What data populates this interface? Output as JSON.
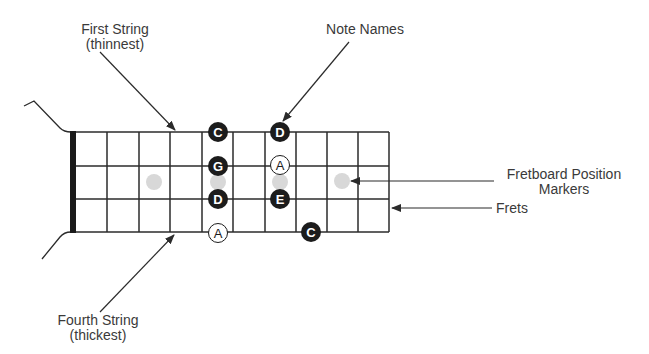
{
  "labels": {
    "first_string": {
      "line1": "First String",
      "line2": "(thinnest)"
    },
    "note_names": {
      "line1": "Note Names"
    },
    "position_markers": {
      "line1": "Fretboard Position",
      "line2": "Markers"
    },
    "frets": {
      "line1": "Frets"
    },
    "fourth_string": {
      "line1": "Fourth String",
      "line2": "(thickest)"
    }
  },
  "fretboard": {
    "strings": 4,
    "fret_spaces": 10,
    "colors": {
      "line": "#2b2b2b",
      "nut": "#1a1a1a",
      "marker": "#d8d8d8",
      "note_fill": "#1c1c1c",
      "note_text": "#ffffff"
    },
    "position_markers": [
      3,
      5,
      7,
      9
    ],
    "notes": [
      {
        "string": 1,
        "fret": 5,
        "name": "C",
        "style": "filled"
      },
      {
        "string": 1,
        "fret": 7,
        "name": "D",
        "style": "filled"
      },
      {
        "string": 2,
        "fret": 5,
        "name": "G",
        "style": "filled"
      },
      {
        "string": 2,
        "fret": 7,
        "name": "A",
        "style": "outlined"
      },
      {
        "string": 3,
        "fret": 5,
        "name": "D",
        "style": "filled"
      },
      {
        "string": 3,
        "fret": 7,
        "name": "E",
        "style": "filled"
      },
      {
        "string": 4,
        "fret": 5,
        "name": "A",
        "style": "outlined"
      },
      {
        "string": 4,
        "fret": 8,
        "name": "C",
        "style": "filled"
      }
    ]
  }
}
